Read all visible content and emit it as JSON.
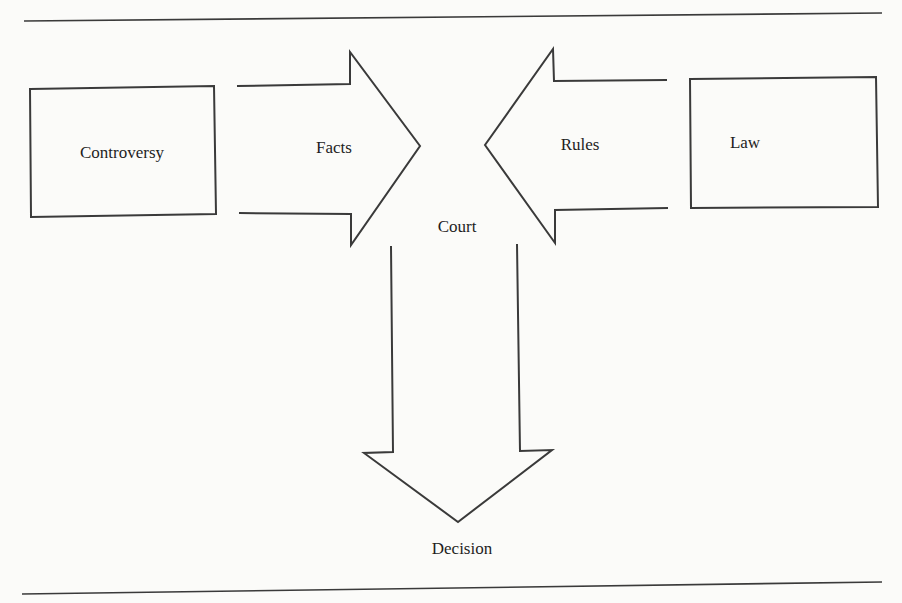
{
  "diagram": {
    "nodes": {
      "controversy": {
        "label": "Controversy"
      },
      "law": {
        "label": "Law"
      },
      "court": {
        "label": "Court"
      },
      "decision": {
        "label": "Decision"
      }
    },
    "edges": {
      "facts": {
        "label": "Facts",
        "from": "Controversy",
        "to": "Court"
      },
      "rules": {
        "label": "Rules",
        "from": "Law",
        "to": "Court"
      },
      "output": {
        "label": "",
        "from": "Court",
        "to": "Decision"
      }
    },
    "colors": {
      "stroke": "#3a3a3a",
      "text": "#1e1e1e",
      "background": "#fbfbf9"
    }
  }
}
